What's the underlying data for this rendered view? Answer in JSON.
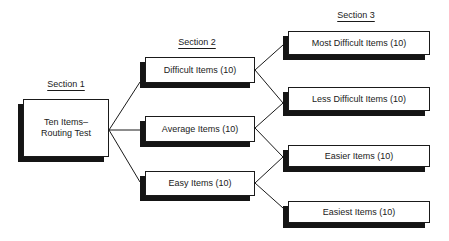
{
  "sections": {
    "s1": {
      "label": "Section 1"
    },
    "s2": {
      "label": "Section 2"
    },
    "s3": {
      "label": "Section 3"
    }
  },
  "boxes": {
    "routing": {
      "line1": "Ten Items–",
      "line2": "Routing Test"
    },
    "difficult": {
      "label": "Difficult Items (10)"
    },
    "average": {
      "label": "Average Items (10)"
    },
    "easy": {
      "label": "Easy Items (10)"
    },
    "most_difficult": {
      "label": "Most Difficult Items (10)"
    },
    "less_difficult": {
      "label": "Less Difficult Items (10)"
    },
    "easier": {
      "label": "Easier Items (10)"
    },
    "easiest": {
      "label": "Easiest Items (10)"
    }
  },
  "colors": {
    "line": "#1a1a1a",
    "shadow": "#151515",
    "background": "#ffffff"
  }
}
